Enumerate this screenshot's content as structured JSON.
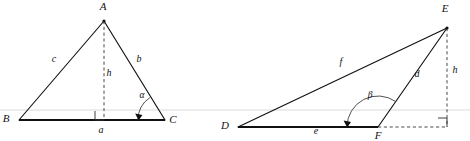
{
  "figure": {
    "background_color": "#ffffff",
    "ink_color": "#111111",
    "guide_color": "#d6d6d6",
    "dashed_color": "#4a4a4a",
    "guide_line": {
      "name": "horizontal-guide-line",
      "y": 110
    },
    "diagrams": [
      {
        "id": "left-triangle",
        "caption": "Acute triangle ABC with altitude h to base a and interior angle alpha at C",
        "vertices": [
          {
            "key": "A",
            "label": "A",
            "x": 104,
            "y": 21,
            "label_x": 103,
            "label_y": 10
          },
          {
            "key": "B",
            "label": "B",
            "x": 19,
            "y": 120,
            "label_x": 6,
            "label_y": 122
          },
          {
            "key": "C",
            "label": "C",
            "x": 165,
            "y": 120,
            "label_x": 173,
            "label_y": 123
          }
        ],
        "foot_of_altitude": {
          "x": 104,
          "y": 120
        },
        "sides": [
          {
            "key": "c",
            "label": "c",
            "from": "B",
            "to": "A",
            "label_x": 54,
            "label_y": 62,
            "style": "solid"
          },
          {
            "key": "b",
            "label": "b",
            "from": "A",
            "to": "C",
            "label_x": 139,
            "label_y": 62,
            "style": "solid"
          },
          {
            "key": "a",
            "label": "a",
            "from": "B",
            "to": "C",
            "label_x": 101,
            "label_y": 133,
            "style": "base"
          }
        ],
        "altitude": {
          "key": "h",
          "label": "h",
          "label_x": 109,
          "label_y": 76,
          "style": "dashed"
        },
        "right_angle": {
          "name": "right-angle-at-foot",
          "x": 95,
          "y": 111,
          "size": 9,
          "orientation": "left"
        },
        "angle": {
          "key": "alpha",
          "label": "α",
          "label_x": 142,
          "label_y": 98,
          "at_vertex": "C",
          "radius": 27,
          "start_deg": 180,
          "end_deg": 124
        }
      },
      {
        "id": "right-triangle",
        "caption": "Obtuse triangle DEF with exterior altitude h and obtuse angle beta at F",
        "vertices": [
          {
            "key": "D",
            "label": "D",
            "x": 238,
            "y": 127,
            "label_x": 225,
            "label_y": 129
          },
          {
            "key": "E",
            "label": "E",
            "x": 447,
            "y": 28,
            "label_x": 445,
            "label_y": 12
          },
          {
            "key": "F",
            "label": "F",
            "x": 378,
            "y": 127,
            "label_x": 375,
            "label_y": 139
          }
        ],
        "foot_of_altitude": {
          "x": 447,
          "y": 127
        },
        "sides": [
          {
            "key": "f",
            "label": "f",
            "from": "D",
            "to": "E",
            "label_x": 341,
            "label_y": 65,
            "style": "solid"
          },
          {
            "key": "d",
            "label": "d",
            "from": "F",
            "to": "E",
            "label_x": 417,
            "label_y": 77,
            "style": "solid"
          },
          {
            "key": "e",
            "label": "e",
            "from": "D",
            "to": "F",
            "label_x": 316,
            "label_y": 134,
            "style": "base"
          }
        ],
        "altitude": {
          "key": "h",
          "label": "h",
          "label_x": 455,
          "label_y": 73,
          "style": "dashed"
        },
        "base_extension": {
          "from_x": 378,
          "to_x": 447,
          "y": 127,
          "style": "dashed"
        },
        "right_angle": {
          "name": "right-angle-at-foot",
          "x": 438,
          "y": 118,
          "size": 9,
          "orientation": "right"
        },
        "angle": {
          "key": "beta",
          "label": "β",
          "label_x": 370,
          "label_y": 98,
          "at_vertex": "F",
          "radius": 31,
          "start_deg": 180,
          "end_deg": 55
        }
      }
    ]
  }
}
